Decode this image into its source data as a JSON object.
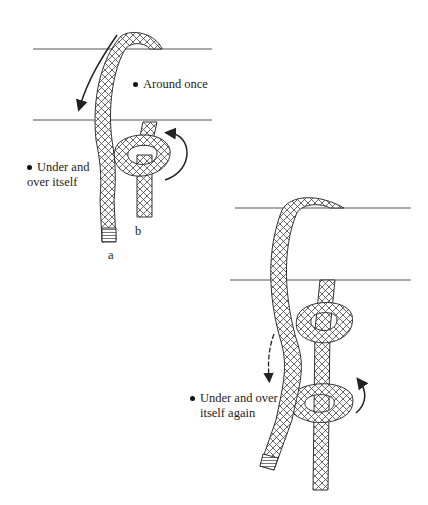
{
  "figure": {
    "panels": [
      {
        "id": "step-1",
        "annotations": [
          {
            "text": "Around once",
            "bullet": true
          },
          {
            "text": "Under and",
            "bullet": true,
            "line2": "over itself"
          }
        ],
        "end_labels": [
          "a",
          "b"
        ]
      },
      {
        "id": "step-2",
        "annotations": [
          {
            "text": "Under and over",
            "bullet": true,
            "line2": "itself again"
          }
        ]
      }
    ],
    "colors": {
      "line": "#555555",
      "rope_outline": "#333333",
      "rope_fill": "#ffffff",
      "hatch": "#444444",
      "arrow": "#222222"
    }
  }
}
